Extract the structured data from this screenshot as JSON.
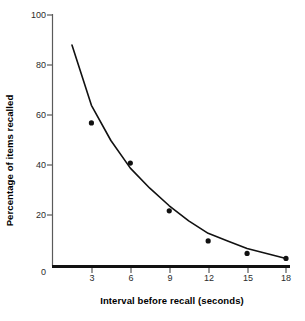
{
  "chart_data": {
    "type": "scatter",
    "title": "",
    "xlabel": "Interval before recall (seconds)",
    "ylabel": "Percentage of items recalled",
    "xlim": [
      0,
      18
    ],
    "ylim": [
      0,
      100
    ],
    "grid": false,
    "legend": "none",
    "x_ticks": [
      "0",
      "3",
      "6",
      "9",
      "12",
      "15",
      "18"
    ],
    "x_tick_values": [
      0,
      3,
      6,
      9,
      12,
      15,
      18
    ],
    "y_ticks": [
      "0",
      "20",
      "40",
      "60",
      "80",
      "100"
    ],
    "y_tick_values": [
      0,
      20,
      40,
      60,
      80,
      100
    ],
    "x": [
      3,
      6,
      9,
      12,
      15,
      18
    ],
    "values": [
      57,
      41,
      22,
      10,
      5,
      3
    ],
    "points": [
      {
        "x": 3,
        "y": 57
      },
      {
        "x": 6,
        "y": 41
      },
      {
        "x": 9,
        "y": 22
      },
      {
        "x": 12,
        "y": 10
      },
      {
        "x": 15,
        "y": 5
      },
      {
        "x": 18,
        "y": 3
      }
    ],
    "series": [
      {
        "name": "Percentage of items recalled",
        "values": [
          57,
          41,
          22,
          10,
          5,
          3
        ],
        "marker": "filled-circle",
        "color": "#111111"
      },
      {
        "name": "fitted decay curve",
        "type": "line",
        "color": "#111111",
        "x": [
          1.5,
          3,
          4.5,
          6,
          7.5,
          9,
          10.5,
          12,
          13.5,
          15,
          16.5,
          18
        ],
        "values": [
          88,
          64,
          50,
          39,
          31,
          24,
          18,
          13,
          10,
          7,
          5,
          3
        ]
      }
    ],
    "marker_color": "#111111",
    "curve_color": "#111111",
    "axis_color": "#555555",
    "baseline_color": "#111111"
  }
}
